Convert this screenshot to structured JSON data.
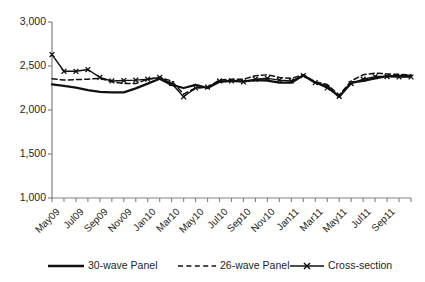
{
  "chart_data": {
    "type": "line",
    "title": "",
    "xlabel": "",
    "ylabel": "",
    "ylim": [
      1000,
      3000
    ],
    "ytick_values": [
      1000,
      1500,
      2000,
      2500,
      3000
    ],
    "ytick_labels": [
      "1,000",
      "1,500",
      "2,000",
      "2,500",
      "3,000"
    ],
    "grid": false,
    "legend_position": "bottom",
    "x": [
      "May09",
      "Jun09",
      "Jul09",
      "Aug09",
      "Sep09",
      "Oct09",
      "Nov09",
      "Dec09",
      "Jan10",
      "Feb10",
      "Mar10",
      "Apr10",
      "May10",
      "Jun10",
      "Jul10",
      "Aug10",
      "Sep10",
      "Oct10",
      "Nov10",
      "Dec10",
      "Jan11",
      "Feb11",
      "Mar11",
      "Apr11",
      "May11",
      "Jun11",
      "Jul11",
      "Aug11",
      "Sep11",
      "Oct11",
      "Nov11"
    ],
    "xtick_labels": [
      "May09",
      "Jul09",
      "Sep09",
      "Nov09",
      "Jan10",
      "Mar10",
      "May10",
      "Jul10",
      "Sep10",
      "Nov10",
      "Jan11",
      "Mar11",
      "May11",
      "Jul11",
      "Sep11"
    ],
    "series": [
      {
        "name": "30-wave Panel",
        "style": "solid",
        "marker": "none",
        "color": "#111111",
        "values": [
          2290,
          2275,
          2255,
          2225,
          2205,
          2200,
          2200,
          2245,
          2300,
          2355,
          2285,
          2250,
          2285,
          2250,
          2320,
          2330,
          2325,
          2340,
          2335,
          2310,
          2310,
          2395,
          2310,
          2270,
          2150,
          2310,
          2330,
          2360,
          2385,
          2385,
          2385
        ]
      },
      {
        "name": "26-wave Panel",
        "style": "dashed",
        "marker": "none",
        "color": "#111111",
        "values": [
          2355,
          2340,
          2345,
          2350,
          2360,
          2320,
          2300,
          2300,
          2350,
          2370,
          2330,
          2180,
          2250,
          2260,
          2340,
          2350,
          2350,
          2390,
          2400,
          2370,
          2360,
          2400,
          2320,
          2290,
          2170,
          2330,
          2400,
          2420,
          2410,
          2405,
          2400
        ]
      },
      {
        "name": "Cross-section",
        "style": "solid",
        "marker": "x",
        "color": "#111111",
        "values": [
          2630,
          2440,
          2440,
          2460,
          2370,
          2330,
          2335,
          2340,
          2350,
          2370,
          2300,
          2150,
          2250,
          2260,
          2330,
          2330,
          2320,
          2350,
          2360,
          2340,
          2330,
          2390,
          2310,
          2250,
          2155,
          2300,
          2350,
          2380,
          2380,
          2375,
          2375
        ]
      }
    ]
  },
  "legend": {
    "items": [
      {
        "label": "30-wave Panel"
      },
      {
        "label": "26-wave Panel"
      },
      {
        "label": "Cross-section"
      }
    ]
  },
  "colors": {
    "line": "#111111",
    "axis": "#808285",
    "text": "#231f20"
  }
}
